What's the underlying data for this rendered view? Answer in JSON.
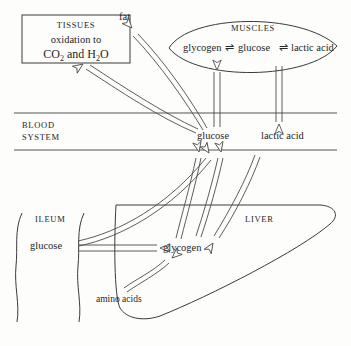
{
  "diagram": {
    "ink_color": "#3a3a3a",
    "background_color": "#fdfdfb"
  },
  "tissues_box": {
    "heading": "TISSUES",
    "line2": "oxidation to",
    "chem_co": "CO",
    "chem_co_sub": "2",
    "chem_and": " and H",
    "chem_h_sub": "2",
    "chem_o": "O"
  },
  "muscles": {
    "heading": "MUSCLES",
    "item1": "glycogen",
    "eq1": "⇌",
    "item2": "glucose",
    "eq2": "⇌",
    "item3": "lactic acid"
  },
  "blood": {
    "label_line1": "BLOOD",
    "label_line2": "SYSTEM",
    "glucose": "glucose",
    "lactic_acid": "lactic acid"
  },
  "ileum": {
    "heading": "ILEUM",
    "glucose": "glucose"
  },
  "liver": {
    "heading": "LIVER",
    "glycogen": "glycogen",
    "amino_acids": "amino acids"
  },
  "other": {
    "fat": "fat"
  }
}
